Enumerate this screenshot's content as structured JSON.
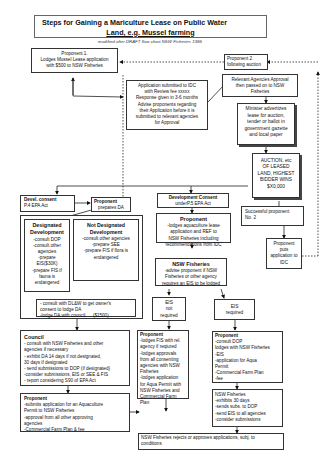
{
  "title": {
    "line1": "Steps  for Gaining a Mariculture Lease on Public Water",
    "line2": "Land, e.g. Mussel farming"
  },
  "subtitle": "modified after DRAFT flow chart NSW Fisheries 1995",
  "nodes": {
    "proponent1": {
      "heading": "Proponent 1.",
      "lines": [
        "Lodges Mussel Lease application",
        "with $500 to NSW Fisheries"
      ]
    },
    "proponent2": {
      "heading": "Proponent 2",
      "lines": [
        "following auction"
      ]
    },
    "idc_application": {
      "lines": [
        "Application submitted to IDC",
        "with Review fee xxxxx",
        "Response given in 3-6 months",
        "Advise proponents regarding",
        "their Application before it is",
        "submitted to relevant agencies",
        "for Approval"
      ]
    },
    "agencies_approval": {
      "lines": [
        "Relevant Agencies Approval",
        "then passed on to NSW",
        "Fisheries"
      ]
    },
    "minister": {
      "lines": [
        "Minister advertizes",
        "lease for auction,",
        "tender or ballot in",
        "government gazette",
        "and local paper"
      ]
    },
    "auction": {
      "lines": [
        "AUCTION, etc",
        "OF LEASED",
        "LAND, HIGHEST",
        "BIDDER WINS",
        "$X0,000"
      ]
    },
    "successful": {
      "lines": [
        "Successful proponent",
        "No. 2"
      ]
    },
    "puts_application": {
      "lines": [
        "Proponent",
        "puts",
        "application to",
        "IDC"
      ]
    },
    "devel_consent": {
      "heading": "Devel. consent",
      "lines": [
        "P.4 EPA Act"
      ]
    },
    "prepares_da": {
      "heading": "Proponent",
      "lines": [
        "prepares DA"
      ]
    },
    "development_consent": {
      "heading": "Development Consent",
      "lines": [
        "underP.5 EPA Act"
      ]
    },
    "proponent_ref": {
      "heading": "Proponent",
      "lines": [
        "-lodges aquaculture lease",
        "application and REF to",
        "NSW Fisheries including",
        "recommendations from IDC"
      ]
    },
    "designated": {
      "heading": "Designated Development",
      "lines": [
        "-consult DOP",
        "-consult other",
        "agencies",
        "-prepare",
        "EIS($30K)",
        "-prepare FIS if",
        "fauna is",
        "endangered"
      ]
    },
    "not_designated": {
      "heading": "Not Designated Development",
      "lines": [
        "-consult other agencies",
        "-prepare SEE",
        "-prepare FIS if flora is",
        "endangered"
      ]
    },
    "dlaw": {
      "lines": [
        "- consult with DL&W to get owner's",
        "consent to lodge DA",
        "-lodge DA with council",
        "($1500)"
      ]
    },
    "nsw_fisheries_advise": {
      "heading": "NSW Fisheries",
      "lines": [
        "-advise proponent if NSW",
        "Fisheries or other agency",
        "requires an EIS to be lodged"
      ]
    },
    "eis_not_required": {
      "lines": [
        "EIS",
        "not",
        "required"
      ]
    },
    "eis_required": {
      "lines": [
        "EIS",
        "required"
      ]
    },
    "council": {
      "heading": "Council",
      "lines": [
        "- consult with NSW Fisheries and other",
        "agencies if necessary",
        "- exhibit DA 14 days if not designated,",
        "30 days if designated",
        "- send submissions to DOP (if designated)",
        "-consider submissions, EIS or SEE & FIS",
        "- report considering S90 of EPA  Act"
      ]
    },
    "proponent_fis": {
      "heading": "Proponent",
      "lines": [
        "-lodges FIS with rel.",
        "agency if reqiured",
        "-lodges approvals",
        "from all consenting",
        "agencies with NSW",
        "Fisheries",
        "-lodges application",
        "for Aqua Permit with",
        "NSW Fisheries and",
        "Commercial Farm",
        "Plan"
      ]
    },
    "proponent_dop": {
      "heading": "Proponent",
      "lines": [
        "-consult DOP",
        "lodges with NSW Fisheries",
        "-EIS",
        "-application for Aqua",
        "Permit",
        "-Commercial Farm Plan",
        "-fee"
      ]
    },
    "nsw_fisheries_exhibit": {
      "heading": "NSW Fisheries",
      "lines": [
        "-exhibits 30 days",
        "-sends subs. to DOP",
        "-send EIS to all agencies",
        "-consider submissions"
      ]
    },
    "proponent_aqua": {
      "heading": "Proponent",
      "lines": [
        "-submits application for an Aquaculture",
        "Permit to NSW Fisheries",
        "-approval from all other approving",
        "agencies",
        "-Commercial Farm Plan & fee"
      ]
    },
    "final": {
      "lines": [
        "NSW Fisheries rejects or approves applications, subj. to",
        "conditions"
      ]
    }
  }
}
